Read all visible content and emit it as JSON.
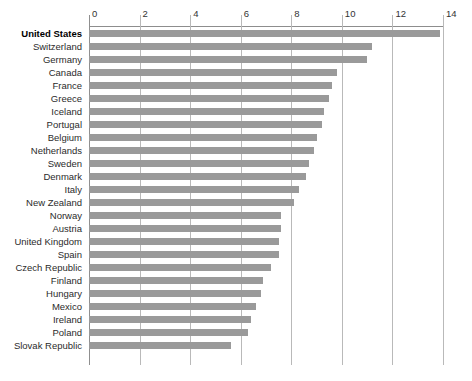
{
  "chart_data": {
    "type": "bar",
    "orientation": "horizontal",
    "title": "",
    "subtitle": "",
    "xlabel": "",
    "ylabel": "",
    "xlim": [
      0,
      14
    ],
    "xticks": [
      0,
      2,
      4,
      6,
      8,
      10,
      12,
      14
    ],
    "xtick_labels": [
      "0",
      "2",
      "4",
      "6",
      "8",
      "10",
      "12",
      "14"
    ],
    "grid": true,
    "legend": null,
    "bar_color": "#9a9a9a",
    "gridline_color": "#b9b9b9",
    "highlight_category": "United States",
    "categories": [
      "United States",
      "Switzerland",
      "Germany",
      "Canada",
      "France",
      "Greece",
      "Iceland",
      "Portugal",
      "Belgium",
      "Netherlands",
      "Sweden",
      "Denmark",
      "Italy",
      "New Zealand",
      "Norway",
      "Austria",
      "United Kingdom",
      "Spain",
      "Czech Republic",
      "Finland",
      "Hungary",
      "Mexico",
      "Ireland",
      "Poland",
      "Slovak Republic"
    ],
    "values": [
      13.9,
      11.2,
      11.0,
      9.8,
      9.6,
      9.5,
      9.3,
      9.2,
      9.0,
      8.9,
      8.7,
      8.6,
      8.3,
      8.1,
      7.6,
      7.6,
      7.5,
      7.5,
      7.2,
      6.9,
      6.8,
      6.6,
      6.4,
      6.3,
      5.6
    ]
  }
}
